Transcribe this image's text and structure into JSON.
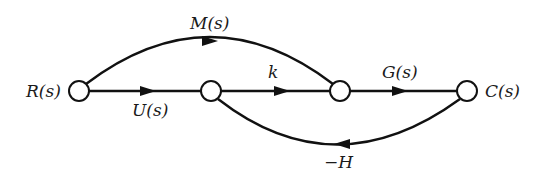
{
  "diagram": {
    "type": "signal-flow-graph",
    "nodes": [
      {
        "id": "R",
        "label": "R(s)",
        "cx": 79,
        "cy": 91
      },
      {
        "id": "n2",
        "label": "",
        "cx": 211,
        "cy": 91
      },
      {
        "id": "n3",
        "label": "",
        "cx": 340,
        "cy": 91
      },
      {
        "id": "C",
        "label": "C(s)",
        "cx": 467,
        "cy": 91
      }
    ],
    "edges": [
      {
        "from": "R",
        "to": "n2",
        "gain": "U(s)"
      },
      {
        "from": "R",
        "to": "n3",
        "gain": "M(s)"
      },
      {
        "from": "n2",
        "to": "n3",
        "gain": "k"
      },
      {
        "from": "n3",
        "to": "C",
        "gain": "G(s)"
      },
      {
        "from": "C",
        "to": "n2",
        "gain": "−H"
      }
    ],
    "labels": {
      "input": "R(s)",
      "output": "C(s)",
      "upper_path": "M(s)",
      "direct_path": "U(s)",
      "middle_gain": "k",
      "forward_gain": "G(s)",
      "feedback_gain": "−H"
    }
  }
}
